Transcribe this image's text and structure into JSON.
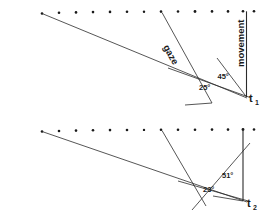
{
  "figure": {
    "width": 266,
    "height": 217,
    "background_color": "#ffffff",
    "line_color": "#2b2b2b",
    "text_color": "#1a1a1a",
    "panels": [
      {
        "id": "panel-t1",
        "time_label": "t",
        "time_subscript": "1",
        "gaze_label": "gaze",
        "movement_label": "movement",
        "angles": [
          {
            "name": "gaze-movement-angle",
            "value": "45°"
          },
          {
            "name": "gaze-stimulus-angle",
            "value": "25°"
          }
        ],
        "dot_count": 14
      },
      {
        "id": "panel-t2",
        "time_label": "t",
        "time_subscript": "2",
        "gaze_label": "",
        "movement_label": "",
        "angles": [
          {
            "name": "gaze-movement-angle",
            "value": "51°"
          },
          {
            "name": "gaze-stimulus-angle",
            "value": "23°"
          }
        ],
        "dot_count": 14
      }
    ]
  }
}
